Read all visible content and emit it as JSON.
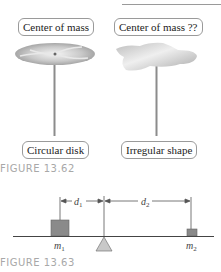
{
  "figure_13_62": {
    "caption": "FIGURE 13.62",
    "left_panel": {
      "top_label": "Center of mass",
      "bottom_label": "Circular disk"
    },
    "right_panel": {
      "top_label": "Center of mass ??",
      "bottom_label": "Irregular shape"
    }
  },
  "figure_13_63": {
    "caption": "FIGURE 13.63",
    "mass_left": "m",
    "mass_left_sub": "1",
    "mass_right": "m",
    "mass_right_sub": "2",
    "distance_left": "d",
    "distance_left_sub": "1",
    "distance_right": "d",
    "distance_right_sub": "2"
  },
  "colors": {
    "caption_gray": "#a8a8a8",
    "mass_fill": "#8a8a8a",
    "fulcrum_fill": "#c8c8c8",
    "line": "#555555"
  }
}
